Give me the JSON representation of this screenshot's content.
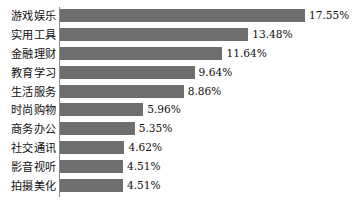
{
  "chart_data": {
    "type": "bar",
    "orientation": "horizontal",
    "title": "",
    "subtitle": "",
    "xlabel": "",
    "ylabel": "",
    "grid": false,
    "legend": null,
    "value_suffix": "%",
    "xlim": [
      0,
      17.55
    ],
    "axis_line": "left-vertical",
    "categories": [
      "游戏娱乐",
      "实用工具",
      "金融理财",
      "教育学习",
      "生活服务",
      "时尚购物",
      "商务办公",
      "社交通讯",
      "影音视听",
      "拍摄美化"
    ],
    "values": [
      17.55,
      13.48,
      11.64,
      9.64,
      8.86,
      5.96,
      5.35,
      4.62,
      4.51,
      4.51
    ],
    "value_labels": [
      "17.55%",
      "13.48%",
      "11.64%",
      "9.64%",
      "8.86%",
      "5.96%",
      "5.35%",
      "4.62%",
      "4.51%",
      "4.51%"
    ],
    "bars": [
      {
        "category": "游戏娱乐",
        "value": 17.55,
        "label": "17.55%"
      },
      {
        "category": "实用工具",
        "value": 13.48,
        "label": "13.48%"
      },
      {
        "category": "金融理财",
        "value": 11.64,
        "label": "11.64%"
      },
      {
        "category": "教育学习",
        "value": 9.64,
        "label": "9.64%"
      },
      {
        "category": "生活服务",
        "value": 8.86,
        "label": "8.86%"
      },
      {
        "category": "时尚购物",
        "value": 5.96,
        "label": "5.96%"
      },
      {
        "category": "商务办公",
        "value": 5.35,
        "label": "5.35%"
      },
      {
        "category": "社交通讯",
        "value": 4.62,
        "label": "4.62%"
      },
      {
        "category": "影音视听",
        "value": 4.51,
        "label": "4.51%"
      },
      {
        "category": "拍摄美化",
        "value": 4.51,
        "label": "4.51%"
      }
    ],
    "colors": {
      "bar": "#6e6e6e",
      "background": "#ffffff",
      "text": "#101010",
      "axis": "#8a8a8a"
    },
    "scale": {
      "pixels_per_unit": 13.96,
      "bar_origin_x": 60
    }
  }
}
